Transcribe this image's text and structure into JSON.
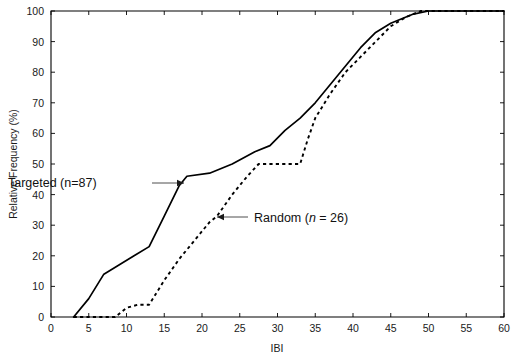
{
  "chart_data": {
    "type": "line",
    "title": "",
    "subtitle": "",
    "xlabel": "IBI",
    "ylabel": "Relative Frequency (%)",
    "xlim": [
      0,
      60
    ],
    "ylim": [
      0,
      100
    ],
    "xticks": [
      0,
      5,
      10,
      15,
      20,
      25,
      30,
      35,
      40,
      45,
      50,
      55,
      60
    ],
    "xtick_labels": [
      "0",
      "5",
      "10",
      "15",
      "20",
      "25",
      "30",
      "35",
      "40",
      "45",
      "50",
      "55",
      "60"
    ],
    "yticks": [
      0,
      10,
      20,
      30,
      40,
      50,
      60,
      70,
      80,
      90,
      100
    ],
    "ytick_labels": [
      "0",
      "10",
      "20",
      "30",
      "40",
      "50",
      "60",
      "70",
      "80",
      "90",
      "100"
    ],
    "grid": false,
    "legend_position": "inline-annotations",
    "series": [
      {
        "name": "Targeted (n=87)",
        "style": "solid",
        "color": "#000000",
        "points": [
          [
            3,
            0
          ],
          [
            5,
            6
          ],
          [
            7,
            14
          ],
          [
            9,
            17
          ],
          [
            11,
            20
          ],
          [
            13,
            23
          ],
          [
            15,
            33
          ],
          [
            17,
            43
          ],
          [
            18,
            46
          ],
          [
            21,
            47
          ],
          [
            24,
            50
          ],
          [
            27,
            54
          ],
          [
            29,
            56
          ],
          [
            31,
            61
          ],
          [
            33,
            65
          ],
          [
            35,
            70
          ],
          [
            38,
            79
          ],
          [
            41,
            88
          ],
          [
            43,
            93
          ],
          [
            45,
            96
          ],
          [
            48,
            99
          ],
          [
            50,
            100
          ],
          [
            60,
            100
          ]
        ]
      },
      {
        "name": "Random (n = 26)",
        "style": "dashed",
        "color": "#000000",
        "points": [
          [
            3,
            0
          ],
          [
            8.5,
            0
          ],
          [
            10,
            3
          ],
          [
            11.5,
            4
          ],
          [
            13,
            4
          ],
          [
            15,
            12
          ],
          [
            17,
            19
          ],
          [
            19,
            25
          ],
          [
            21,
            31
          ],
          [
            22,
            33
          ],
          [
            24,
            40
          ],
          [
            26,
            46
          ],
          [
            27.5,
            50
          ],
          [
            33,
            50
          ],
          [
            34,
            58
          ],
          [
            35,
            65
          ],
          [
            37,
            73
          ],
          [
            39,
            80
          ],
          [
            41,
            85
          ],
          [
            43,
            90
          ],
          [
            45,
            95
          ],
          [
            47,
            98
          ],
          [
            49,
            100
          ],
          [
            60,
            100
          ]
        ]
      }
    ],
    "annotations": [
      {
        "id": "targeted-annotation",
        "text_prefix": "Targeted (n=87)",
        "text_italic": "",
        "text_suffix": "",
        "label_x": 8,
        "label_y": 187,
        "leader_from_x": 152,
        "leader_from_y": 183,
        "leader_to_x": 184,
        "leader_to_y": 183
      },
      {
        "id": "random-annotation",
        "text_prefix": "Random (",
        "text_italic": "n",
        "text_suffix": " = 26)",
        "label_x": 254,
        "label_y": 222,
        "leader_from_x": 248,
        "leader_from_y": 217,
        "leader_to_x": 217,
        "leader_to_y": 217
      }
    ]
  },
  "figure": {
    "background_color": "#ffffff",
    "axis_color": "#000000",
    "text_color": "#1a1a1a",
    "plot_left": 51,
    "plot_right": 504,
    "plot_top": 11,
    "plot_bottom": 317
  }
}
